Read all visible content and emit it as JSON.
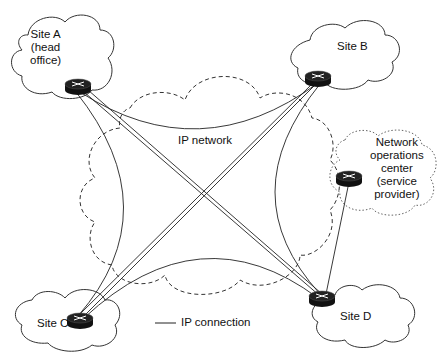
{
  "diagram": {
    "center_label": "IP network",
    "legend": {
      "label": "IP connection",
      "line_style": "solid"
    },
    "nodes": [
      {
        "id": "site-a",
        "label_lines": [
          "Site A",
          "(head",
          "office)"
        ],
        "type": "router",
        "cloud": "solid"
      },
      {
        "id": "site-b",
        "label_lines": [
          "Site B"
        ],
        "type": "router",
        "cloud": "solid"
      },
      {
        "id": "site-c",
        "label_lines": [
          "Site C"
        ],
        "type": "router",
        "cloud": "solid"
      },
      {
        "id": "site-d",
        "label_lines": [
          "Site D"
        ],
        "type": "router",
        "cloud": "solid"
      },
      {
        "id": "noc",
        "label_lines": [
          "Network",
          "operations",
          "center",
          "(service",
          "provider)"
        ],
        "type": "router",
        "cloud": "dotted"
      }
    ],
    "edges": [
      {
        "from": "site-a",
        "to": "site-b",
        "style": "curved"
      },
      {
        "from": "site-a",
        "to": "site-c",
        "style": "curved"
      },
      {
        "from": "site-a",
        "to": "site-d",
        "style": "straight"
      },
      {
        "from": "site-b",
        "to": "site-c",
        "style": "straight"
      },
      {
        "from": "site-b",
        "to": "site-d",
        "style": "curved"
      },
      {
        "from": "site-c",
        "to": "site-d",
        "style": "curved"
      },
      {
        "from": "noc",
        "to": "site-d",
        "style": "straight"
      }
    ],
    "colors": {
      "line": "#222222",
      "router": "#111111",
      "background": "#ffffff"
    }
  }
}
